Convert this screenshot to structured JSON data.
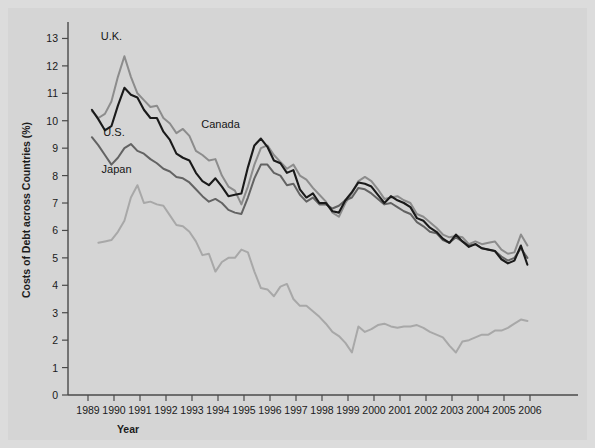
{
  "figure": {
    "background_color": "#d5d5d5",
    "frame_color": "#dcdcdc"
  },
  "axis": {
    "ylabel": "Costs of Debt across Countries (%)",
    "xlabel": "Year",
    "y_ticks": [
      "0",
      "1",
      "2",
      "3",
      "4",
      "5",
      "6",
      "7",
      "8",
      "9",
      "10",
      "11",
      "12",
      "13"
    ],
    "x_ticks": [
      "1989",
      "1990",
      "1991",
      "1992",
      "1993",
      "1994",
      "1995",
      "1996",
      "1997",
      "1998",
      "1999",
      "2000",
      "2001",
      "2002",
      "2003",
      "2004",
      "2005",
      "2006"
    ]
  },
  "annotations": {
    "uk": "U.K.",
    "us": "U.S.",
    "japan": "Japan",
    "canada": "Canada"
  },
  "chart_data": {
    "type": "line",
    "title": "",
    "xlabel": "Year",
    "ylabel": "Costs of Debt across Countries (%)",
    "xlim": [
      1989.0,
      2006.0
    ],
    "ylim": [
      0,
      13.6
    ],
    "grid": false,
    "legend": "inline-labels",
    "x_tick_labels": [
      "1989",
      "1990",
      "1991",
      "1992",
      "1993",
      "1994",
      "1995",
      "1996",
      "1997",
      "1998",
      "1999",
      "2000",
      "2001",
      "2002",
      "2003",
      "2004",
      "2005",
      "2006"
    ],
    "y_tick_labels": [
      "0",
      "1",
      "2",
      "3",
      "4",
      "5",
      "6",
      "7",
      "8",
      "9",
      "10",
      "11",
      "12",
      "13"
    ],
    "series": [
      {
        "name": "U.K.",
        "color": "#8c8c8c",
        "label_position": {
          "x": 1989.9,
          "y": 12.95
        },
        "x": [
          1989.15,
          1989.4,
          1989.65,
          1989.9,
          1990.15,
          1990.4,
          1990.65,
          1990.9,
          1991.15,
          1991.4,
          1991.65,
          1991.9,
          1992.15,
          1992.4,
          1992.65,
          1992.9,
          1993.15,
          1993.4,
          1993.65,
          1993.9,
          1994.15,
          1994.4,
          1994.65,
          1994.9,
          1995.15,
          1995.4,
          1995.65,
          1995.9,
          1996.15,
          1996.4,
          1996.65,
          1996.9,
          1997.15,
          1997.4,
          1997.65,
          1997.9,
          1998.15,
          1998.4,
          1998.65,
          1998.9,
          1999.15,
          1999.4,
          1999.65,
          1999.9,
          2000.15,
          2000.4,
          2000.65,
          2000.9,
          2001.15,
          2001.4,
          2001.65,
          2001.9,
          2002.15,
          2002.4,
          2002.65,
          2002.9,
          2003.15,
          2003.4,
          2003.65,
          2003.9,
          2004.15,
          2004.4,
          2004.65,
          2004.9,
          2005.15,
          2005.4,
          2005.65,
          2005.9
        ],
        "y": [
          10.35,
          10.1,
          10.25,
          10.7,
          11.6,
          12.35,
          11.6,
          11.0,
          10.75,
          10.5,
          10.55,
          10.1,
          9.9,
          9.55,
          9.7,
          9.45,
          8.9,
          8.75,
          8.55,
          8.6,
          8.0,
          7.6,
          7.45,
          6.95,
          7.6,
          8.4,
          9.0,
          9.1,
          8.75,
          8.5,
          8.25,
          8.4,
          8.0,
          7.85,
          7.55,
          7.3,
          7.05,
          6.65,
          6.5,
          7.0,
          7.35,
          7.8,
          7.95,
          7.8,
          7.5,
          7.15,
          7.2,
          7.25,
          7.1,
          7.0,
          6.6,
          6.5,
          6.3,
          6.1,
          5.85,
          5.75,
          5.8,
          5.75,
          5.5,
          5.6,
          5.5,
          5.55,
          5.6,
          5.3,
          5.15,
          5.2,
          5.85,
          5.45
        ]
      },
      {
        "name": "Canada",
        "color": "#1a1a1a",
        "label_position": {
          "x": 1994.1,
          "y": 9.75
        },
        "x": [
          1989.15,
          1989.4,
          1989.65,
          1989.9,
          1990.15,
          1990.4,
          1990.65,
          1990.9,
          1991.15,
          1991.4,
          1991.65,
          1991.9,
          1992.15,
          1992.4,
          1992.65,
          1992.9,
          1993.15,
          1993.4,
          1993.65,
          1993.9,
          1994.15,
          1994.4,
          1994.65,
          1994.9,
          1995.15,
          1995.4,
          1995.65,
          1995.9,
          1996.15,
          1996.4,
          1996.65,
          1996.9,
          1997.15,
          1997.4,
          1997.65,
          1997.9,
          1998.15,
          1998.4,
          1998.65,
          1998.9,
          1999.15,
          1999.4,
          1999.65,
          1999.9,
          2000.15,
          2000.4,
          2000.65,
          2000.9,
          2001.15,
          2001.4,
          2001.65,
          2001.9,
          2002.15,
          2002.4,
          2002.65,
          2002.9,
          2003.15,
          2003.4,
          2003.65,
          2003.9,
          2004.15,
          2004.4,
          2004.65,
          2004.9,
          2005.15,
          2005.4,
          2005.65,
          2005.9
        ],
        "y": [
          10.4,
          10.05,
          9.65,
          9.8,
          10.55,
          11.2,
          10.95,
          10.85,
          10.4,
          10.1,
          10.1,
          9.6,
          9.3,
          8.8,
          8.65,
          8.55,
          8.1,
          7.8,
          7.65,
          7.9,
          7.6,
          7.25,
          7.3,
          7.35,
          8.3,
          9.1,
          9.35,
          9.05,
          8.55,
          8.45,
          8.1,
          8.2,
          7.5,
          7.2,
          7.35,
          7.0,
          7.0,
          6.7,
          6.65,
          7.1,
          7.4,
          7.75,
          7.7,
          7.6,
          7.3,
          7.0,
          7.25,
          7.1,
          7.0,
          6.85,
          6.45,
          6.35,
          6.1,
          5.95,
          5.7,
          5.55,
          5.85,
          5.6,
          5.4,
          5.5,
          5.35,
          5.3,
          5.25,
          4.95,
          4.8,
          4.9,
          5.45,
          4.75
        ]
      },
      {
        "name": "U.S.",
        "color": "#636363",
        "label_position": {
          "x": 1990.0,
          "y": 9.45
        },
        "x": [
          1989.15,
          1989.4,
          1989.65,
          1989.9,
          1990.15,
          1990.4,
          1990.65,
          1990.9,
          1991.15,
          1991.4,
          1991.65,
          1991.9,
          1992.15,
          1992.4,
          1992.65,
          1992.9,
          1993.15,
          1993.4,
          1993.65,
          1993.9,
          1994.15,
          1994.4,
          1994.65,
          1994.9,
          1995.15,
          1995.4,
          1995.65,
          1995.9,
          1996.15,
          1996.4,
          1996.65,
          1996.9,
          1997.15,
          1997.4,
          1997.65,
          1997.9,
          1998.15,
          1998.4,
          1998.65,
          1998.9,
          1999.15,
          1999.4,
          1999.65,
          1999.9,
          2000.15,
          2000.4,
          2000.65,
          2000.9,
          2001.15,
          2001.4,
          2001.65,
          2001.9,
          2002.15,
          2002.4,
          2002.65,
          2002.9,
          2003.15,
          2003.4,
          2003.65,
          2003.9,
          2004.15,
          2004.4,
          2004.65,
          2004.9,
          2005.15,
          2005.4,
          2005.65,
          2005.9
        ],
        "y": [
          9.4,
          9.1,
          8.75,
          8.4,
          8.65,
          9.0,
          9.15,
          8.9,
          8.8,
          8.6,
          8.45,
          8.25,
          8.15,
          7.95,
          7.9,
          7.75,
          7.5,
          7.25,
          7.05,
          7.15,
          7.0,
          6.75,
          6.65,
          6.6,
          7.2,
          7.9,
          8.4,
          8.4,
          8.1,
          8.0,
          7.65,
          7.7,
          7.3,
          7.05,
          7.2,
          6.95,
          6.95,
          6.8,
          6.9,
          7.1,
          7.2,
          7.55,
          7.5,
          7.35,
          7.15,
          6.95,
          7.0,
          6.85,
          6.7,
          6.6,
          6.3,
          6.15,
          5.95,
          5.9,
          5.65,
          5.55,
          5.75,
          5.6,
          5.45,
          5.5,
          5.35,
          5.3,
          5.25,
          5.05,
          4.9,
          5.0,
          5.35,
          5.0
        ]
      },
      {
        "name": "Japan",
        "color": "#a8a8a8",
        "label_position": {
          "x": 1990.1,
          "y": 8.1
        },
        "x": [
          1989.4,
          1989.65,
          1989.9,
          1990.15,
          1990.4,
          1990.65,
          1990.9,
          1991.15,
          1991.4,
          1991.65,
          1991.9,
          1992.15,
          1992.4,
          1992.65,
          1992.9,
          1993.15,
          1993.4,
          1993.65,
          1993.9,
          1994.15,
          1994.4,
          1994.65,
          1994.9,
          1995.15,
          1995.4,
          1995.65,
          1995.9,
          1996.15,
          1996.4,
          1996.65,
          1996.9,
          1997.15,
          1997.4,
          1997.65,
          1997.9,
          1998.15,
          1998.4,
          1998.65,
          1998.9,
          1999.15,
          1999.4,
          1999.65,
          1999.9,
          2000.15,
          2000.4,
          2000.65,
          2000.9,
          2001.15,
          2001.4,
          2001.65,
          2001.9,
          2002.15,
          2002.4,
          2002.65,
          2002.9,
          2003.15,
          2003.4,
          2003.65,
          2003.9,
          2004.15,
          2004.4,
          2004.65,
          2004.9,
          2005.15,
          2005.4,
          2005.65,
          2005.9
        ],
        "y": [
          5.55,
          5.6,
          5.65,
          5.95,
          6.35,
          7.2,
          7.65,
          7.0,
          7.05,
          6.95,
          6.9,
          6.55,
          6.2,
          6.15,
          5.95,
          5.6,
          5.1,
          5.15,
          4.5,
          4.85,
          5.0,
          5.0,
          5.3,
          5.2,
          4.5,
          3.9,
          3.85,
          3.6,
          3.95,
          4.05,
          3.5,
          3.25,
          3.25,
          3.05,
          2.85,
          2.6,
          2.3,
          2.15,
          1.9,
          1.55,
          2.5,
          2.3,
          2.4,
          2.55,
          2.6,
          2.5,
          2.45,
          2.5,
          2.5,
          2.55,
          2.45,
          2.3,
          2.2,
          2.1,
          1.8,
          1.55,
          1.95,
          2.0,
          2.1,
          2.2,
          2.2,
          2.35,
          2.35,
          2.45,
          2.6,
          2.75,
          2.7
        ]
      }
    ]
  }
}
